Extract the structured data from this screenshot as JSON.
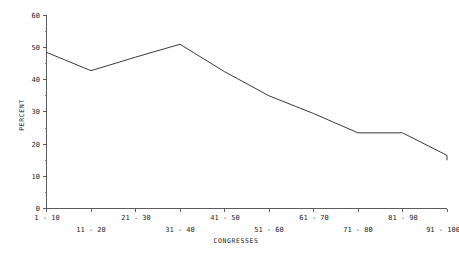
{
  "chart_data": {
    "type": "line",
    "title": "",
    "xlabel": "CONGRESSES",
    "ylabel": "PERCENT",
    "categories": [
      "1 - 10",
      "11 - 20",
      "21 - 30",
      "31 - 40",
      "41 - 50",
      "51 - 60",
      "61 - 70",
      "71 - 80",
      "81 - 90",
      "91 - 100"
    ],
    "values": [
      48.5,
      42.8,
      47.0,
      51.0,
      42.5,
      35.0,
      29.5,
      23.5,
      23.5,
      16.5
    ],
    "series": [
      {
        "name": "PERCENT",
        "values": [
          48.5,
          42.8,
          47.0,
          51.0,
          42.5,
          35.0,
          29.5,
          23.5,
          23.5,
          16.5
        ]
      }
    ],
    "trailing_point": {
      "value": 15.0,
      "note": "line continues to right edge of axis"
    },
    "ylim": [
      0,
      60
    ],
    "y_major_ticks": [
      0,
      10,
      20,
      30,
      40,
      50,
      60
    ],
    "y_minor_ticks": [
      5,
      15,
      25,
      35,
      45,
      55
    ],
    "y_tick_labels": [
      "0",
      "10",
      "20",
      "30",
      "40",
      "50",
      "60"
    ],
    "grid": false,
    "legend": false,
    "legend_position": "none",
    "line_color": "#3a3a3a",
    "axis_color": "#4a4a4a"
  },
  "axes": {
    "y_title": "PERCENT",
    "x_title": "CONGRESSES"
  },
  "x_labels_row_top": [
    "1 - 10",
    "21 - 30",
    "41 - 50",
    "61 - 70",
    "81 - 90"
  ],
  "x_labels_row_bottom": [
    "11 - 20",
    "31 - 40",
    "51 - 60",
    "71 - 80",
    "91 - 100"
  ]
}
